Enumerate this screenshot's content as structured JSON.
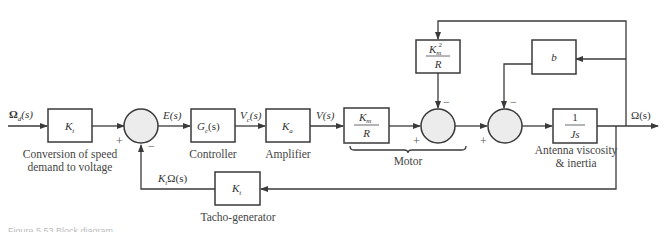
{
  "diagram": {
    "type": "block-diagram",
    "input_signal": "Ω_d(s)",
    "output_signal": "Ω(s)",
    "blocks": [
      {
        "id": "conv",
        "label_main": "K",
        "label_sub": "t",
        "caption_line1": "Conversion of speed",
        "caption_line2": "demand to voltage"
      },
      {
        "id": "controller",
        "label_main": "G",
        "label_sub": "c",
        "label_tail": "(s)",
        "caption": "Controller"
      },
      {
        "id": "amplifier",
        "label_main": "K",
        "label_sub": "a",
        "caption": "Amplifier"
      },
      {
        "id": "motor_gain",
        "num_main": "K",
        "num_sub": "m",
        "den": "R"
      },
      {
        "id": "back_emf",
        "num_main": "K",
        "num_sub": "m",
        "num_sup": "2",
        "den": "R"
      },
      {
        "id": "viscosity",
        "label": "b"
      },
      {
        "id": "inertia",
        "num": "1",
        "den": "Js",
        "caption_line1": "Antenna viscosity",
        "caption_line2": "& inertia"
      },
      {
        "id": "tacho",
        "label_main": "K",
        "label_sub": "t",
        "caption": "Tacho-generator"
      }
    ],
    "signals": {
      "input_main": "Ω",
      "input_sub": "d",
      "input_tail": "(s)",
      "error": "E(s)",
      "vc_main": "V",
      "vc_sub": "c",
      "vc_tail": "(s)",
      "v": "V(s)",
      "output": "Ω(s)",
      "feedback_main": "K",
      "feedback_sub": "t",
      "feedback_tail": "Ω(s)"
    },
    "signs": {
      "plus": "+",
      "minus": "−"
    },
    "group_label": "Motor",
    "figure_caption": "Figure 5.53 Block diagram"
  }
}
